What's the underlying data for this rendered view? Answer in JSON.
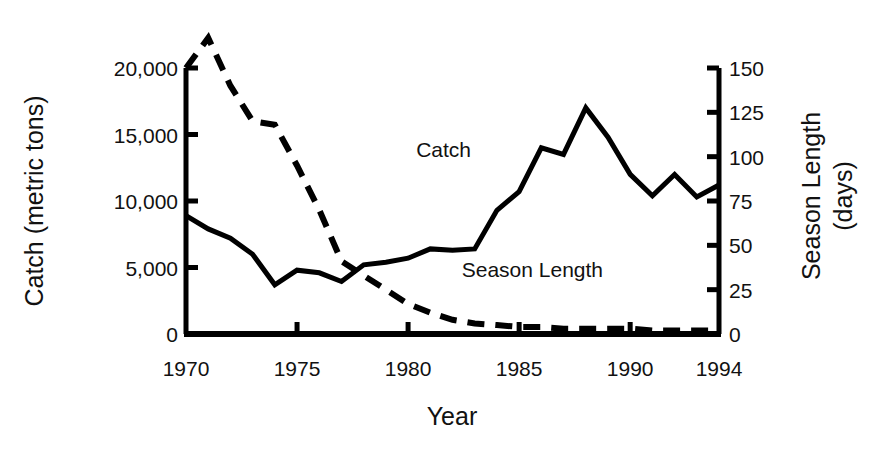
{
  "chart_data": {
    "type": "line",
    "title": "",
    "xlabel": "Year",
    "ylabel": "Catch (metric tons)",
    "y2label_line1": "Season Length",
    "y2label_line2": "(days)",
    "grid": false,
    "legend_position": "inline-annotations",
    "xlim": [
      1970,
      1994
    ],
    "ylim": [
      0,
      20000
    ],
    "y2lim": [
      0,
      150
    ],
    "xticks": [
      1970,
      1975,
      1980,
      1985,
      1990,
      1994
    ],
    "xtick_labels": [
      "1970",
      "1975",
      "1980",
      "1985",
      "1990",
      "1994"
    ],
    "yticks": [
      0,
      5000,
      10000,
      15000,
      20000
    ],
    "ytick_labels": [
      "0",
      "5,000",
      "10,000",
      "15,000",
      "20,000"
    ],
    "y2ticks": [
      0,
      25,
      50,
      75,
      100,
      125,
      150
    ],
    "y2tick_labels": [
      "0",
      "25",
      "50",
      "75",
      "100",
      "125",
      "150"
    ],
    "x": [
      1970,
      1971,
      1972,
      1973,
      1974,
      1975,
      1976,
      1977,
      1978,
      1979,
      1980,
      1981,
      1982,
      1983,
      1984,
      1985,
      1986,
      1987,
      1988,
      1989,
      1990,
      1991,
      1992,
      1993,
      1994
    ],
    "series": [
      {
        "name": "Catch",
        "axis": "left",
        "style": "solid",
        "color": "#000000",
        "unit": "metric tons",
        "values": [
          8900,
          7900,
          7200,
          6000,
          3700,
          4800,
          4600,
          3950,
          5200,
          5400,
          5700,
          6400,
          6300,
          6400,
          9300,
          10700,
          14000,
          13500,
          17000,
          14800,
          12000,
          10400,
          12000,
          10300,
          11200
        ]
      },
      {
        "name": "Season Length",
        "axis": "right",
        "style": "dashed",
        "color": "#000000",
        "unit": "days",
        "values": [
          150,
          167,
          140,
          120,
          118,
          95,
          70,
          41,
          33,
          25,
          17,
          12,
          8,
          6,
          5,
          4,
          4,
          3,
          3,
          3,
          3,
          2,
          2,
          2,
          2
        ]
      }
    ],
    "annotations": [
      {
        "text": "Catch",
        "x": 1981.6,
        "y_axis": "left",
        "y": 13300
      },
      {
        "text": "Season Length",
        "x": 1985.6,
        "y_axis": "left",
        "y": 4300
      }
    ]
  }
}
